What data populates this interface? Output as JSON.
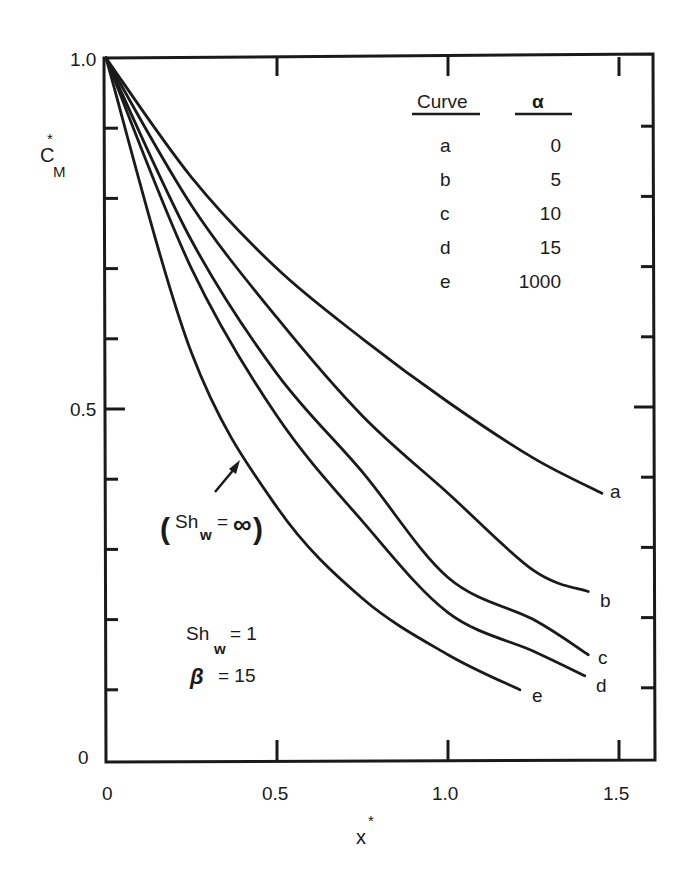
{
  "chart_data": {
    "type": "line",
    "title": "",
    "xlabel": "x*",
    "ylabel": "C_M*",
    "xlim": [
      0,
      1.6
    ],
    "ylim": [
      0,
      1.0
    ],
    "grid": false,
    "x_ticks": [
      "0",
      "0.5",
      "1.0",
      "1.5"
    ],
    "y_ticks": [
      "0",
      "0.5",
      "1.0"
    ],
    "legend_position": "upper right (table)",
    "legend_table": {
      "headers": [
        "Curve",
        "α"
      ],
      "rows": [
        {
          "curve": "a",
          "alpha": "0"
        },
        {
          "curve": "b",
          "alpha": "5"
        },
        {
          "curve": "c",
          "alpha": "10"
        },
        {
          "curve": "d",
          "alpha": "15"
        },
        {
          "curve": "e",
          "alpha": "1000"
        }
      ]
    },
    "series": [
      {
        "name": "a",
        "alpha": 0,
        "x": [
          0,
          0.25,
          0.5,
          0.75,
          1.0,
          1.25,
          1.45
        ],
        "y": [
          1.0,
          0.83,
          0.7,
          0.6,
          0.51,
          0.43,
          0.38
        ]
      },
      {
        "name": "b",
        "alpha": 5,
        "x": [
          0,
          0.25,
          0.5,
          0.75,
          1.0,
          1.25,
          1.41
        ],
        "y": [
          1.0,
          0.79,
          0.63,
          0.49,
          0.38,
          0.27,
          0.24
        ]
      },
      {
        "name": "c",
        "alpha": 10,
        "x": [
          0,
          0.25,
          0.5,
          0.75,
          1.0,
          1.25,
          1.41
        ],
        "y": [
          1.0,
          0.74,
          0.55,
          0.41,
          0.26,
          0.2,
          0.15
        ]
      },
      {
        "name": "d",
        "alpha": 15,
        "x": [
          0,
          0.25,
          0.5,
          0.75,
          1.0,
          1.25,
          1.4
        ],
        "y": [
          1.0,
          0.7,
          0.49,
          0.34,
          0.21,
          0.155,
          0.12
        ]
      },
      {
        "name": "e",
        "alpha": 1000,
        "x": [
          0,
          0.25,
          0.5,
          0.75,
          1.0,
          1.21
        ],
        "y": [
          1.0,
          0.58,
          0.36,
          0.23,
          0.15,
          0.1
        ]
      }
    ],
    "annotations": [
      {
        "text": "(Sh_w = ∞)",
        "points_to": "curve e"
      },
      {
        "text": "Sh_w = 1"
      },
      {
        "text": "β = 15"
      }
    ]
  },
  "labels": {
    "y_axis_main": "C",
    "y_axis_sub": "M",
    "y_axis_sup": "*",
    "x_axis_main": "x",
    "x_axis_sup": "*",
    "x_ticks": [
      "0",
      "0.5",
      "1.0",
      "1.5"
    ],
    "y_ticks": [
      "0",
      "0.5",
      "1.0"
    ],
    "legend_header_curve": "Curve",
    "legend_header_alpha": "α",
    "legend_rows": [
      {
        "curve": "a",
        "alpha": "0"
      },
      {
        "curve": "b",
        "alpha": "5"
      },
      {
        "curve": "c",
        "alpha": "10"
      },
      {
        "curve": "d",
        "alpha": "15"
      },
      {
        "curve": "e",
        "alpha": "1000"
      }
    ],
    "curve_tags": [
      "a",
      "b",
      "c",
      "d",
      "e"
    ],
    "annot_inf_open": "(",
    "annot_inf_sh": "Sh",
    "annot_inf_sub": "w",
    "annot_inf_eq": "=",
    "annot_inf_val": "∞",
    "annot_inf_close": ")",
    "annot_sh": "Sh",
    "annot_sh_sub": "w",
    "annot_sh_val": "= 1",
    "annot_beta": "β",
    "annot_beta_val": "= 15"
  }
}
